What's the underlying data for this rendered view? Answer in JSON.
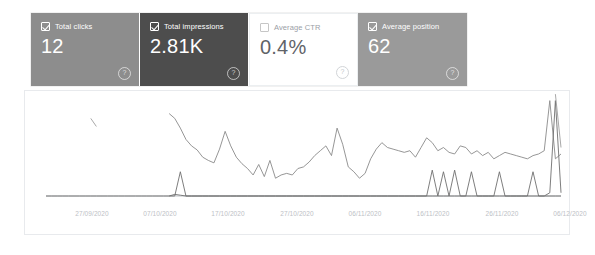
{
  "cards": [
    {
      "name": "total-clicks",
      "label": "Total clicks",
      "value": "12",
      "checked": true,
      "selected": true,
      "help": "?"
    },
    {
      "name": "total-impressions",
      "label": "Total impressions",
      "value": "2.81K",
      "checked": true,
      "selected": true,
      "help": "?"
    },
    {
      "name": "average-ctr",
      "label": "Average CTR",
      "value": "0.4%",
      "checked": false,
      "selected": false,
      "help": "?"
    },
    {
      "name": "average-position",
      "label": "Average position",
      "value": "62",
      "checked": true,
      "selected": true,
      "help": "?"
    }
  ],
  "colors": {
    "clicks_card": "#8d8d8d",
    "impressions_card": "#4d4d4d",
    "ctr_card": "#ffffff",
    "position_card": "#9a9a9a",
    "clicks_line": "#6f6f6f",
    "impressions_line": "#8a8a8a",
    "position_line": "#9e9e9e",
    "axis": "#bdc1c6",
    "panel_border": "#e8eaed"
  },
  "chart_data": {
    "type": "line",
    "title": "",
    "xlabel": "",
    "ylabel": "",
    "grid": false,
    "legend": "none",
    "xtick_labels": [
      "27/09/2020",
      "07/10/2020",
      "17/10/2020",
      "27/10/2020",
      "06/11/2020",
      "16/11/2020",
      "26/11/2020",
      "06/12/2020"
    ],
    "xtick_positions": [
      67,
      135,
      203,
      272,
      340,
      408,
      477,
      545
    ],
    "x_range": [
      "24/09/2020",
      "11/12/2020"
    ],
    "series": [
      {
        "name": "Total impressions",
        "color": "#8a8a8a",
        "ylim": [
          0,
          120
        ],
        "values": [
          null,
          null,
          null,
          null,
          null,
          null,
          null,
          null,
          null,
          null,
          null,
          null,
          null,
          null,
          null,
          null,
          null,
          null,
          null,
          null,
          null,
          null,
          102,
          96,
          84,
          70,
          62,
          57,
          48,
          44,
          41,
          58,
          80,
          62,
          48,
          40,
          34,
          26,
          39,
          24,
          44,
          22,
          26,
          28,
          26,
          34,
          36,
          42,
          50,
          56,
          62,
          50,
          84,
          64,
          36,
          30,
          22,
          28,
          46,
          58,
          66,
          60,
          58,
          56,
          54,
          56,
          48,
          60,
          72,
          66,
          56,
          60,
          54,
          52,
          62,
          60,
          52,
          56,
          50,
          54,
          46,
          50,
          54,
          52,
          50,
          48,
          46,
          50,
          52,
          56,
          118,
          46,
          52
        ]
      },
      {
        "name": "Total clicks",
        "color": "#6f6f6f",
        "ylim": [
          0,
          120
        ],
        "values": [
          0,
          0,
          0,
          0,
          0,
          0,
          0,
          0,
          0,
          0,
          0,
          0,
          0,
          0,
          0,
          0,
          0,
          0,
          0,
          0,
          0,
          0,
          0,
          2,
          1,
          0,
          0,
          0,
          0,
          0,
          0,
          0,
          0,
          0,
          0,
          0,
          0,
          0,
          0,
          0,
          0,
          0,
          0,
          0,
          0,
          0,
          0,
          0,
          0,
          0,
          0,
          0,
          0,
          0,
          0,
          0,
          0,
          0,
          0,
          0,
          0,
          0,
          0,
          0,
          0,
          0,
          0,
          0,
          0,
          0,
          0,
          0,
          0,
          0,
          0,
          0,
          0,
          0,
          0,
          0,
          0,
          0,
          0,
          0,
          0,
          0,
          0,
          0,
          0,
          0,
          0,
          0,
          0
        ]
      },
      {
        "name": "Total clicks (spikes)",
        "color": "#6f6f6f",
        "ylim": [
          0,
          120
        ],
        "values": [
          null,
          null,
          null,
          null,
          null,
          null,
          null,
          null,
          null,
          null,
          null,
          null,
          null,
          null,
          null,
          null,
          null,
          null,
          null,
          null,
          null,
          null,
          0,
          0,
          30,
          0,
          0,
          0,
          0,
          0,
          0,
          0,
          0,
          0,
          0,
          0,
          0,
          0,
          0,
          0,
          0,
          0,
          0,
          0,
          0,
          0,
          0,
          0,
          0,
          0,
          0,
          0,
          0,
          0,
          0,
          0,
          0,
          0,
          0,
          0,
          0,
          0,
          0,
          0,
          0,
          0,
          0,
          0,
          0,
          32,
          0,
          30,
          0,
          32,
          0,
          0,
          30,
          0,
          0,
          0,
          0,
          30,
          0,
          0,
          0,
          0,
          0,
          30,
          0,
          0,
          4,
          118,
          4
        ]
      },
      {
        "name": "Average position",
        "color": "#9e9e9e",
        "ylim": [
          0,
          120
        ],
        "values": [
          null,
          null,
          null,
          null,
          null,
          null,
          null,
          null,
          96,
          86,
          null,
          null,
          null,
          null,
          null,
          null,
          null,
          null,
          null,
          null,
          null,
          null,
          null,
          null,
          null,
          null,
          null,
          null,
          null,
          null,
          null,
          null,
          null,
          null,
          null,
          null,
          null,
          null,
          null,
          null,
          null,
          null,
          null,
          null,
          null,
          null,
          null,
          null,
          null,
          null,
          null,
          null,
          null,
          null,
          null,
          null,
          null,
          null,
          null,
          null,
          null,
          null,
          null,
          null,
          null,
          null,
          null,
          null,
          null,
          null,
          null,
          null,
          null,
          null,
          null,
          null,
          null,
          null,
          null,
          null,
          null,
          null,
          null,
          null,
          null,
          null,
          null,
          null,
          null,
          null,
          null,
          126,
          60
        ]
      }
    ]
  }
}
